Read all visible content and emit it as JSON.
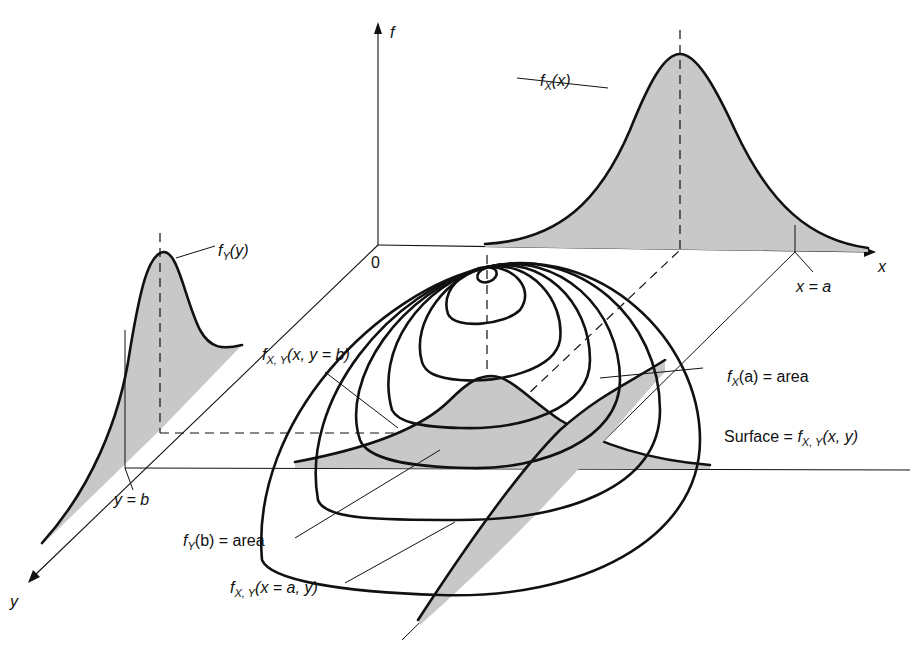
{
  "diagram": {
    "type": "3d-joint-density-illustration",
    "colors": {
      "line": "#111111",
      "shade": "#c8c8c8",
      "background": "#ffffff"
    },
    "axes": {
      "f_label": "f",
      "x_label": "x",
      "y_label": "y",
      "origin_label": "0"
    },
    "labels": {
      "fx_x": {
        "f": "f",
        "sub": "X",
        "rest": "(x)"
      },
      "fy_y": {
        "f": "f",
        "sub": "Y",
        "rest": "(y)"
      },
      "x_eq_a": "x = a",
      "y_eq_b": "y = b",
      "fxy_y_b": {
        "f": "f",
        "sub": "X, Y",
        "rest": "(x, y = b)"
      },
      "fx_a_area": {
        "f": "f",
        "sub": "X",
        "rest": "(a) = area"
      },
      "surface": {
        "prefix": "Surface = ",
        "f": "f",
        "sub": "X, Y",
        "rest": "(x, y)"
      },
      "fy_b_area": {
        "f": "f",
        "sub": "Y",
        "rest": "(b) = area"
      },
      "fxy_x_a": {
        "f": "f",
        "sub": "X, Y",
        "rest": "(x = a, y)"
      }
    }
  }
}
